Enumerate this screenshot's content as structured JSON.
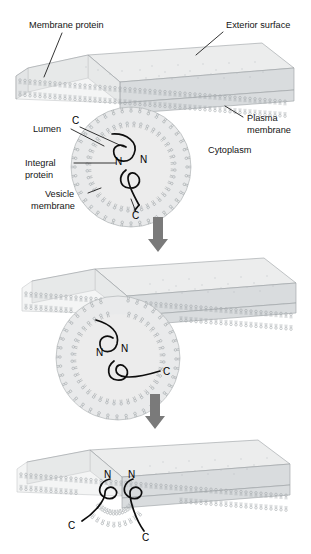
{
  "figure": {
    "background_color": "#ffffff",
    "ink_color": "#141414",
    "membrane_color": "#e3e5e6",
    "arrow_color": "#7a7a7a"
  },
  "labels": {
    "membrane_protein": "Membrane protein",
    "exterior_surface": "Exterior surface",
    "plasma_membrane_line1": "Plasma",
    "plasma_membrane_line2": "membrane",
    "cytoplasm": "Cytoplasm",
    "lumen": "Lumen",
    "integral_protein_line1": "Integral",
    "integral_protein_line2": "protein",
    "vesicle_membrane_line1": "Vesicle",
    "vesicle_membrane_line2": "membrane"
  },
  "termini": {
    "n": "N",
    "c": "C"
  },
  "panels": [
    {
      "id": "panel-1",
      "step": 1,
      "caption": "Vesicle approaches the plasma membrane",
      "termini_marks": [
        {
          "type": "C",
          "text": "C",
          "x": 76,
          "y": 121
        },
        {
          "type": "N",
          "text": "N",
          "x": 119,
          "y": 161
        },
        {
          "type": "N",
          "text": "N",
          "x": 143,
          "y": 159
        },
        {
          "type": "C",
          "text": "C",
          "x": 135,
          "y": 213
        }
      ]
    },
    {
      "id": "panel-2",
      "step": 2,
      "caption": "Vesicle membrane fuses and opens a pore",
      "termini_marks": [
        {
          "type": "N",
          "text": "N",
          "x": 100,
          "y": 352
        },
        {
          "type": "N",
          "text": "N",
          "x": 124,
          "y": 348
        },
        {
          "type": "C",
          "text": "C",
          "x": 164,
          "y": 374
        }
      ]
    },
    {
      "id": "panel-3",
      "step": 3,
      "caption": "Proteins are now integrated into the plasma membrane",
      "termini_marks": [
        {
          "type": "N",
          "text": "N",
          "x": 108,
          "y": 475
        },
        {
          "type": "N",
          "text": "N",
          "x": 131,
          "y": 475
        },
        {
          "type": "C",
          "text": "C",
          "x": 72,
          "y": 525
        },
        {
          "type": "C",
          "text": "C",
          "x": 146,
          "y": 537
        }
      ]
    }
  ],
  "arrows": [
    {
      "id": "arrow-1",
      "direction": "down",
      "x": 158,
      "y_top": 218,
      "y_bottom": 252
    },
    {
      "id": "arrow-2",
      "direction": "down",
      "x": 155,
      "y_top": 395,
      "y_bottom": 428
    }
  ]
}
